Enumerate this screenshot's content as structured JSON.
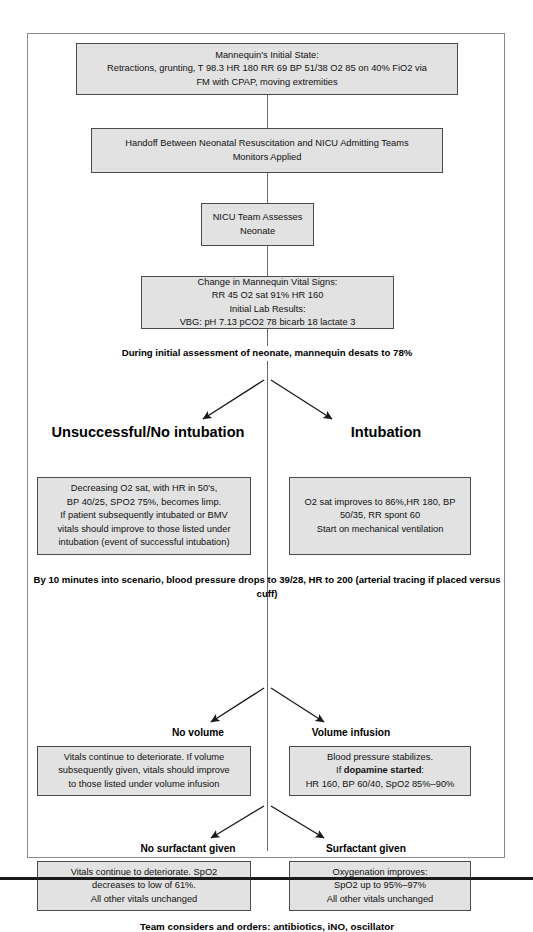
{
  "diagram": {
    "colors": {
      "box_fill": "#e2e2e2",
      "box_border": "#4a4a4a",
      "line": "#6e6e6e",
      "frame": "#8a8a8a",
      "rule": "#1a1a1a",
      "text": "#000000"
    },
    "nodes": {
      "initial_state": {
        "line1": "Mannequin's Initial State:",
        "line2": "Retractions, grunting, T 98.3 HR 180 RR 69 BP 51/38 O2 85 on 40% FiO2 via",
        "line3": "FM with CPAP, moving extremities"
      },
      "handoff": {
        "line1": "Handoff Between Neonatal Resuscitation and NICU Admitting Teams",
        "line2": "Monitors Applied"
      },
      "assess": {
        "line1": "NICU Team Assesses",
        "line2": "Neonate"
      },
      "vitals_change": {
        "line1": "Change in Mannequin Vital Signs:",
        "line2": "RR 45 O2 sat 91% HR 160",
        "line3": "Initial Lab Results:",
        "line4": "VBG: pH 7.13 pCO2 78 bicarb 18 lactate 3"
      },
      "no_intubation_box": {
        "line1": "Decreasing O2 sat, with HR in 50's,",
        "line2": "BP 40/25, SPO2 75%, becomes limp.",
        "line3": "If patient subsequently intubated or BMV",
        "line4": "vitals should improve to those listed under",
        "line5": "intubation (event of successful intubation)"
      },
      "intubation_box": {
        "line1": "O2 sat improves to 86%,HR 180, BP",
        "line2": "50/35, RR spont 60",
        "line3": "Start on mechanical ventilation"
      },
      "no_volume_box": {
        "line1": "Vitals continue to deteriorate. If volume",
        "line2": "subsequently given, vitals should improve",
        "line3": "to those listed under volume infusion"
      },
      "volume_infusion_box": {
        "line1": "Blood pressure stabilizes.",
        "line2_prefix": "If ",
        "line2_bold": "dopamine started",
        "line2_suffix": ":",
        "line3": "HR 160, BP 60/40, SpO2 85%–90%"
      },
      "no_surfactant_box": {
        "line1": "Vitals continue to deteriorate. SpO2",
        "line2": "decreases to low of 61%.",
        "line3": "All other vitals unchanged"
      },
      "surfactant_box": {
        "line1": "Oxygenation improves:",
        "line2": "SpO2 up to 95%–97%",
        "line3": "All other vitals unchanged"
      }
    },
    "transitions": {
      "desat": "During initial assessment of neonate, mannequin desats to 78%",
      "bp_drop_line1": "By 10 minutes into scenario, blood pressure drops to 39/28, HR to 200",
      "bp_drop_line2": "(arterial tracing if placed versus cuff)"
    },
    "branch_labels": {
      "unsuccessful_intubation": "Unsuccessful/No intubation",
      "intubation": "Intubation",
      "no_volume": "No volume",
      "volume_infusion": "Volume infusion",
      "no_surfactant": "No surfactant given",
      "surfactant": "Surfactant given"
    },
    "footer": "Team considers and orders: antibiotics, iNO, oscillator"
  }
}
